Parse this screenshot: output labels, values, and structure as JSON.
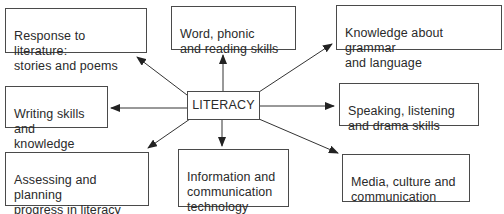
{
  "diagram": {
    "type": "hub-and-spoke",
    "center": {
      "label": "LITERACY"
    },
    "nodes": [
      {
        "id": "response",
        "label": "Response to literature:\nstories and poems"
      },
      {
        "id": "word",
        "label": "Word, phonic\nand reading skills"
      },
      {
        "id": "grammar",
        "label": "Knowledge about grammar\nand language"
      },
      {
        "id": "writing",
        "label": "Writing skills\nand knowledge"
      },
      {
        "id": "speaking",
        "label": "Speaking, listening\nand drama skills"
      },
      {
        "id": "assessing",
        "label": "Assessing and planning\nprogress in literacy and\nuses of literacy"
      },
      {
        "id": "ict",
        "label": "Information and\ncommunication\ntechnology"
      },
      {
        "id": "media",
        "label": "Media, culture and\ncommunication"
      }
    ],
    "edges": [
      {
        "from": "LITERACY",
        "to": "response"
      },
      {
        "from": "LITERACY",
        "to": "word"
      },
      {
        "from": "LITERACY",
        "to": "grammar"
      },
      {
        "from": "LITERACY",
        "to": "writing"
      },
      {
        "from": "LITERACY",
        "to": "speaking"
      },
      {
        "from": "LITERACY",
        "to": "assessing"
      },
      {
        "from": "LITERACY",
        "to": "ict"
      },
      {
        "from": "LITERACY",
        "to": "media"
      }
    ],
    "colors": {
      "line": "#333333",
      "border": "#4a4a4a",
      "text": "#2a2a2a",
      "background": "#ffffff"
    }
  }
}
